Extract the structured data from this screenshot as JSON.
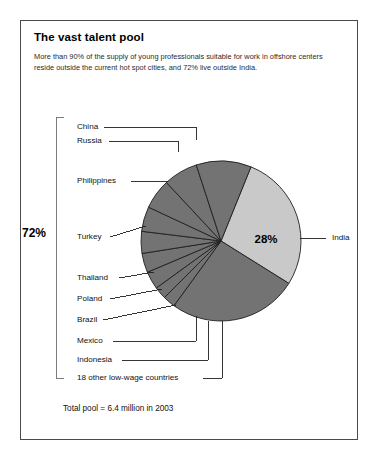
{
  "figure": {
    "title": "The vast talent pool",
    "subtitle": "More than 90% of the supply of young professionals suitable for work in offshore centers reside outside the current hot spot cities, and 72% live outside India.",
    "footnote": "Total pool = 6.4 million in 2003",
    "bracket_label": "72%",
    "center_label": "28%"
  },
  "colors": {
    "india_slice": "#c9c9c9",
    "other_slice": "#737373",
    "slice_outline": "#1f1f1f",
    "frame_border": "#4a4a4a",
    "leader_line": "#1f1f1f",
    "text": "#111111",
    "background": "#ffffff"
  },
  "chart_data": {
    "type": "pie",
    "title": "The vast talent pool",
    "subtitle": "More than 90% of the supply of young professionals suitable for work in offshore centers reside outside the current hot spot cities, and 72% live outside India.",
    "annotation": "Total pool = 6.4 million in 2003",
    "total_label": "Total pool = 6.4 million in 2003",
    "units": "share of total talent pool (%)",
    "legend_position": "callout-labels",
    "data_labels": [
      "28%",
      "72%"
    ],
    "groups": [
      {
        "name": "India",
        "value": 28,
        "color": "#c9c9c9"
      },
      {
        "name": "Outside India",
        "value": 72,
        "color": "#737373"
      }
    ],
    "categories": [
      "India",
      "18 other low-wage countries",
      "China",
      "Russia",
      "Philippines",
      "Turkey",
      "Thailand",
      "Poland",
      "Brazil",
      "Mexico",
      "Indonesia"
    ],
    "values": [
      28,
      26,
      11,
      7,
      6,
      5,
      4.5,
      4,
      3.5,
      2.5,
      2.5
    ],
    "slices": [
      {
        "label": "India",
        "value": 28,
        "start_deg": 22,
        "end_deg": 122,
        "color": "#c9c9c9",
        "inside_label": "28%"
      },
      {
        "label": "18 other low-wage countries",
        "value": 26,
        "start_deg": 122,
        "end_deg": 216,
        "color": "#737373",
        "inside_label": ""
      },
      {
        "label": "Indonesia",
        "value": 2.5,
        "start_deg": 216,
        "end_deg": 225,
        "color": "#737373",
        "inside_label": ""
      },
      {
        "label": "Mexico",
        "value": 2.5,
        "start_deg": 225,
        "end_deg": 234,
        "color": "#737373",
        "inside_label": ""
      },
      {
        "label": "Brazil",
        "value": 3.5,
        "start_deg": 234,
        "end_deg": 247,
        "color": "#737373",
        "inside_label": ""
      },
      {
        "label": "Poland",
        "value": 4,
        "start_deg": 247,
        "end_deg": 261,
        "color": "#737373",
        "inside_label": ""
      },
      {
        "label": "Thailand",
        "value": 4.5,
        "start_deg": 261,
        "end_deg": 277,
        "color": "#737373",
        "inside_label": ""
      },
      {
        "label": "Turkey",
        "value": 5,
        "start_deg": 277,
        "end_deg": 295,
        "color": "#737373",
        "inside_label": ""
      },
      {
        "label": "Philippines",
        "value": 6,
        "start_deg": 295,
        "end_deg": 317,
        "color": "#737373",
        "inside_label": ""
      },
      {
        "label": "Russia",
        "value": 7,
        "start_deg": 317,
        "end_deg": 342,
        "color": "#737373",
        "inside_label": ""
      },
      {
        "label": "China",
        "value": 11,
        "start_deg": 342,
        "end_deg": 382,
        "color": "#737373",
        "inside_label": ""
      }
    ],
    "callouts": [
      {
        "label": "China",
        "side": "left",
        "x": 77,
        "y": 127
      },
      {
        "label": "Russia",
        "side": "left",
        "x": 77,
        "y": 141
      },
      {
        "label": "Philippines",
        "side": "left",
        "x": 77,
        "y": 181
      },
      {
        "label": "Turkey",
        "side": "left",
        "x": 77,
        "y": 237
      },
      {
        "label": "Thailand",
        "side": "left",
        "x": 77,
        "y": 278
      },
      {
        "label": "Poland",
        "side": "left",
        "x": 77,
        "y": 299
      },
      {
        "label": "Brazil",
        "side": "left",
        "x": 77,
        "y": 320
      },
      {
        "label": "Mexico",
        "side": "left",
        "x": 77,
        "y": 341
      },
      {
        "label": "Indonesia",
        "side": "left",
        "x": 77,
        "y": 360
      },
      {
        "label": "18 other low-wage countries",
        "side": "left",
        "x": 77,
        "y": 378
      },
      {
        "label": "India",
        "side": "right",
        "x": 332,
        "y": 238
      }
    ]
  }
}
